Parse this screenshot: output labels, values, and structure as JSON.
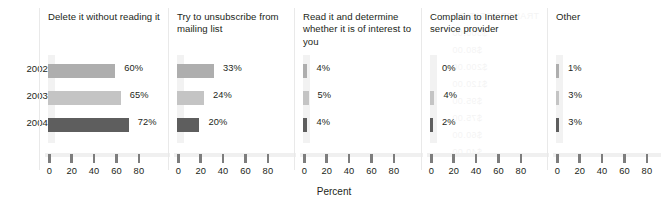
{
  "chart_data": {
    "type": "bar",
    "orientation": "horizontal",
    "layout": "small-multiples",
    "title": "",
    "xlabel": "Percent",
    "ylabel": "",
    "xlim": [
      0,
      90
    ],
    "xticks": [
      0,
      20,
      40,
      60,
      80
    ],
    "grid": false,
    "legend": "none",
    "categories": [
      "2002",
      "2003",
      "2004"
    ],
    "panels": [
      {
        "label": "Delete it without reading it",
        "values": [
          60,
          65,
          72
        ],
        "value_labels": [
          "60%",
          "65%",
          "72%"
        ]
      },
      {
        "label": "Try to unsubscribe from mailing list",
        "values": [
          33,
          24,
          20
        ],
        "value_labels": [
          "33%",
          "24%",
          "20%"
        ]
      },
      {
        "label": "Read it and determine whether it is of interest to you",
        "values": [
          4,
          5,
          4
        ],
        "value_labels": [
          "4%",
          "5%",
          "4%"
        ]
      },
      {
        "label": "Complain to Internet service provider",
        "values": [
          0,
          4,
          2
        ],
        "value_labels": [
          "0%",
          "4%",
          "2%"
        ]
      },
      {
        "label": "Other",
        "values": [
          1,
          3,
          3
        ],
        "value_labels": [
          "1%",
          "3%",
          "3%"
        ]
      }
    ],
    "series_colors": [
      "#aeaeae",
      "#c4c4c4",
      "#5e5e5e"
    ]
  },
  "axis": {
    "x_title": "Percent"
  },
  "watermark": {
    "lines": [
      "TRANSPORTATION",
      "$500.00",
      "$80.00",
      "$200.00",
      "$120.00",
      "$95.00",
      "$75.00",
      "$60.00",
      "$40.00"
    ]
  }
}
